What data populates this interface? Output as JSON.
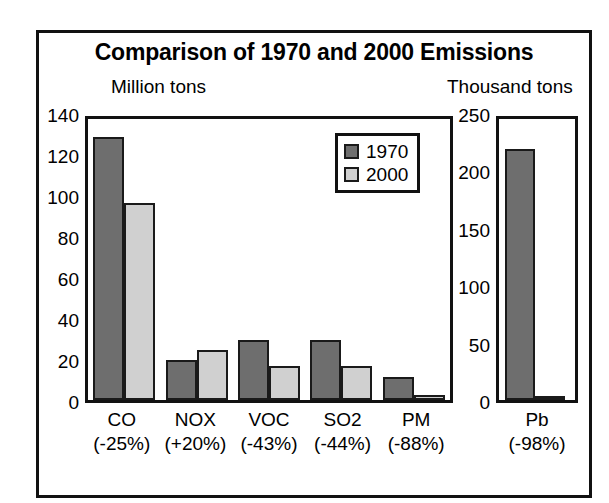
{
  "chart_data": {
    "type": "bar",
    "title": "Comparison of 1970 and 2000 Emissions",
    "categories": [
      "CO",
      "NOX",
      "VOC",
      "SO2",
      "PM",
      "Pb"
    ],
    "category_changes": [
      "(-25%)",
      "(+20%)",
      "(-43%)",
      "(-44%)",
      "(-88%)",
      "(-98%)"
    ],
    "series": [
      {
        "name": "1970",
        "color": "#6e6e6e",
        "values": [
          131,
          20,
          30,
          30,
          11.5,
          223
        ]
      },
      {
        "name": "2000",
        "color": "#d0d0d0",
        "values": [
          98,
          25,
          17,
          17,
          2.5,
          4
        ]
      }
    ],
    "panels": [
      {
        "id": "left",
        "ylabel": "Million tons",
        "ylim": [
          0,
          140
        ],
        "yticks": [
          0,
          20,
          40,
          60,
          80,
          100,
          120,
          140
        ],
        "categories": [
          "CO",
          "NOX",
          "VOC",
          "SO2",
          "PM"
        ]
      },
      {
        "id": "right",
        "ylabel": "Thousand tons",
        "ylim": [
          0,
          250
        ],
        "yticks": [
          0,
          50,
          100,
          150,
          200,
          250
        ],
        "categories": [
          "Pb"
        ]
      }
    ],
    "legend": {
      "position": "upper-right-inside-left-panel",
      "entries": [
        "1970",
        "2000"
      ]
    },
    "grid": false,
    "xlabel": ""
  }
}
